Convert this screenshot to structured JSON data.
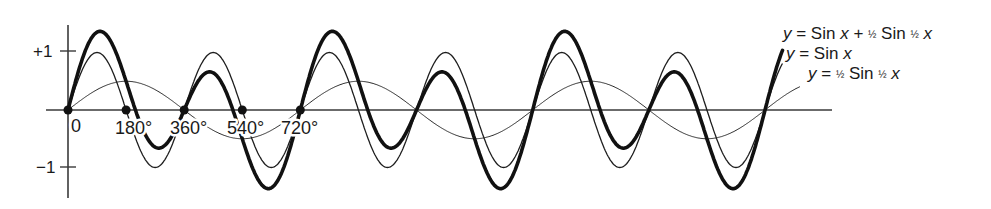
{
  "figure": {
    "width": 991,
    "height": 209,
    "background": "#ffffff",
    "ink": "#111111"
  },
  "chart_data": {
    "type": "line",
    "title": "",
    "xlabel": "x (degrees)",
    "ylabel": "y",
    "xlim": [
      -70,
      2360
    ],
    "ylim": [
      -1.55,
      1.55
    ],
    "grid": false,
    "y_ticks": [
      {
        "value": 1,
        "label": "+1"
      },
      {
        "value": -1,
        "label": "−1"
      }
    ],
    "x_tick_labels": [
      {
        "value": 0,
        "label": "0"
      },
      {
        "value": 180,
        "label": "180°"
      },
      {
        "value": 360,
        "label": "360°"
      },
      {
        "value": 540,
        "label": "540°"
      },
      {
        "value": 720,
        "label": "720°"
      }
    ],
    "marked_points": [
      0,
      180,
      360,
      540,
      720
    ],
    "x_range_plotted": [
      0,
      2215
    ],
    "series": [
      {
        "name": "y = Sin x + ½ Sin ½ x",
        "style": "thick",
        "formula": "sin(x) + 0.5*sin(x/2)",
        "x": [
          0,
          45,
          90,
          135,
          180,
          225,
          270,
          315,
          360,
          405,
          450,
          495,
          540,
          585,
          630,
          675,
          720
        ],
        "values": [
          0,
          0.9,
          1.35,
          1.17,
          0.5,
          -0.24,
          -0.65,
          -0.52,
          0,
          0.52,
          0.65,
          0.24,
          -0.5,
          -1.17,
          -1.35,
          -0.9,
          0
        ]
      },
      {
        "name": "y = Sin x",
        "style": "medium",
        "formula": "sin(x)",
        "x": [
          0,
          90,
          180,
          270,
          360,
          450,
          540,
          630,
          720
        ],
        "values": [
          0,
          1,
          0,
          -1,
          0,
          1,
          0,
          -1,
          0
        ]
      },
      {
        "name": "y = ½ Sin ½ x",
        "style": "thin",
        "formula": "0.5*sin(x/2)",
        "x": [
          0,
          180,
          360,
          540,
          720
        ],
        "values": [
          0,
          0.5,
          0,
          -0.5,
          0
        ]
      }
    ],
    "legend_position": "right, adjacent to curve ends",
    "annotations": "curves repeat with period 720° and are drawn through about 2215°"
  },
  "labels": {
    "y_plus_one": "+1",
    "y_minus_one": "−1",
    "x_zero": "0",
    "x_180": "180°",
    "x_360": "360°",
    "x_540": "540°",
    "x_720": "720°"
  },
  "legend": {
    "combined": {
      "y": "y",
      "eq": " = Sin ",
      "x1": "x",
      "plus": " + ",
      "half1": "½",
      "sin2": " Sin ",
      "half2": "½",
      "x2": " x"
    },
    "sine": {
      "y": "y",
      "eq": " = Sin ",
      "x": "x"
    },
    "half_sine": {
      "y": "y",
      "eq": " = ",
      "half1": "½",
      "sin": " Sin ",
      "half2": "½",
      "x": " x"
    }
  },
  "layout": {
    "origin_px": [
      68,
      110
    ],
    "px_per_degree": 0.3227,
    "px_per_unit": 57.5,
    "x_end_deg": 2215,
    "half_end_deg": 2270
  }
}
